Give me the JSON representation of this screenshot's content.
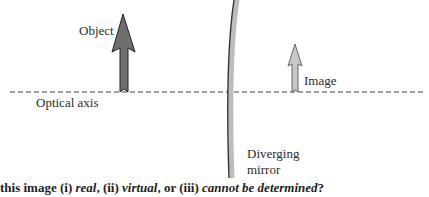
{
  "diagram": {
    "labels": {
      "object": "Object",
      "image": "Image",
      "optical_axis": "Optical axis",
      "mirror_line1": "Diverging",
      "mirror_line2": "mirror"
    },
    "question": {
      "prefix": "this image (i) ",
      "opt1": "real",
      "sep1": ", (ii) ",
      "opt2": "virtual",
      "sep2": ", or (iii) ",
      "opt3": "cannot be determined",
      "suffix": "?"
    },
    "colors": {
      "object_arrow_fill": "#6e6e6e",
      "image_arrow_fill": "#c8c8c8",
      "mirror_stroke": "#333333",
      "mirror_shadow": "#bdbdbd",
      "axis_stroke": "#444444"
    }
  }
}
